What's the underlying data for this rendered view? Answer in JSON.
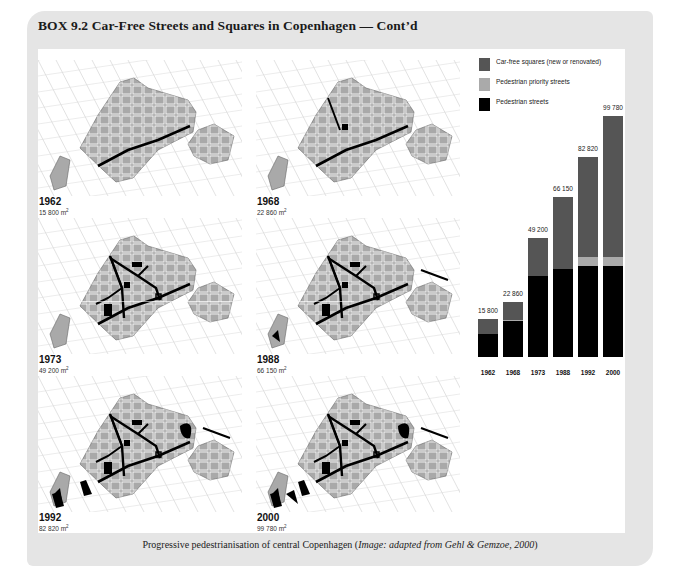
{
  "box": {
    "title": "BOX 9.2  Car-Free Streets and Squares in Copenhagen — Cont’d"
  },
  "maps": [
    {
      "year": "1962",
      "area": "15 800 m",
      "unit_sup": "2",
      "ped_streets": "low"
    },
    {
      "year": "1968",
      "area": "22 860 m",
      "unit_sup": "2",
      "ped_streets": "low-plus"
    },
    {
      "year": "1973",
      "area": "49 200 m",
      "unit_sup": "2",
      "ped_streets": "network"
    },
    {
      "year": "1988",
      "area": "66 150 m",
      "unit_sup": "2",
      "ped_streets": "network-plus"
    },
    {
      "year": "1992",
      "area": "82 820 m",
      "unit_sup": "2",
      "ped_streets": "network-squares"
    },
    {
      "year": "2000",
      "area": "99 780 m",
      "unit_sup": "2",
      "ped_streets": "network-squares-plus"
    }
  ],
  "legend": [
    {
      "label": "Car-free squares (new or renovated)",
      "color": "#555555"
    },
    {
      "label": "Pedestrian priority streets",
      "color": "#aaaaaa"
    },
    {
      "label": "Pedestrian streets",
      "color": "#000000"
    }
  ],
  "chart_data": {
    "type": "bar",
    "stacked": true,
    "title": "",
    "xlabel": "",
    "ylabel": "Car-free area (m²)",
    "categories": [
      "1962",
      "1968",
      "1973",
      "1988",
      "1992",
      "2000"
    ],
    "totals": [
      15800,
      22860,
      49200,
      66150,
      82820,
      99780
    ],
    "total_labels": [
      "15 800",
      "22 860",
      "49 200",
      "66 150",
      "82 820",
      "99 780"
    ],
    "series": [
      {
        "name": "Pedestrian streets",
        "color": "#000000",
        "values": [
          9300,
          14800,
          33600,
          36200,
          37400,
          37400
        ]
      },
      {
        "name": "Pedestrian priority streets",
        "color": "#aaaaaa",
        "values": [
          0,
          560,
          0,
          0,
          3900,
          3900
        ]
      },
      {
        "name": "Car-free squares (new or renovated)",
        "color": "#555555",
        "values": [
          6500,
          7500,
          15600,
          29950,
          41520,
          58480
        ]
      }
    ],
    "ylim": [
      0,
      100000
    ],
    "grid": false,
    "legend_position": "top"
  },
  "caption": {
    "main": "Progressive pedestrianisation of central Copenhagen (",
    "credit": "Image: adapted from Gehl & Gemzoe, 2000",
    "close": ")"
  }
}
